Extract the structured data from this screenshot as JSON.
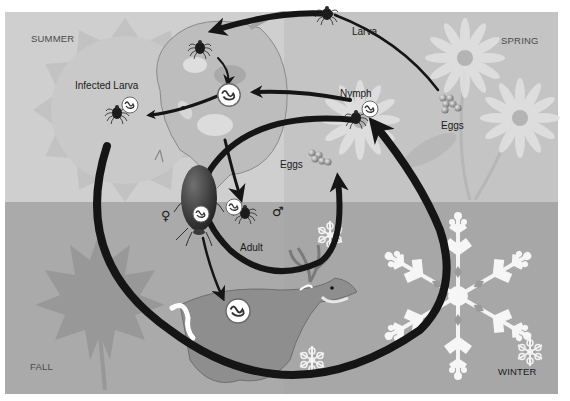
{
  "diagram": {
    "colors": {
      "summer_bg": "#cfcfcf",
      "spring_bg": "#c4c4c4",
      "fall_bg": "#aaaaaa",
      "winter_bg": "#a7a7a7",
      "arrow": "#151515",
      "border": "#ffffff"
    },
    "seasons": {
      "summer": "SUMMER",
      "spring": "SPRING",
      "fall": "FALL",
      "winter": "WINTER"
    },
    "stages": {
      "larva": "Larva",
      "infected_larva": "Infected Larva",
      "nymph": "Nymph",
      "eggs_spring": "Eggs",
      "eggs_center": "Eggs",
      "adult": "Adult"
    },
    "symbols": {
      "female": "♀",
      "male": "♂"
    },
    "hosts": [
      "mouse",
      "deer"
    ],
    "pathogen_markers": [
      "on-mouse",
      "infected-larva",
      "nymph",
      "adult-female",
      "adult-male",
      "on-deer"
    ],
    "background_icons": [
      "sun",
      "daisy-flowers",
      "maple-leaf",
      "snowflakes"
    ]
  }
}
